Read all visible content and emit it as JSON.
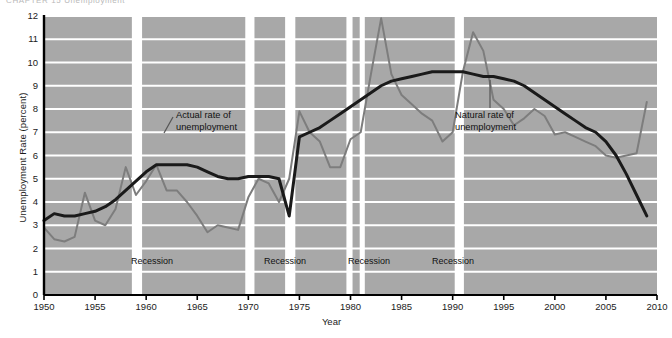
{
  "figure": {
    "top_fragment": "CHAPTER 15  Unemployment",
    "background_color": "#ffffff",
    "plot_band_color": "#a8a8a8",
    "gridline_color": "#ffffff",
    "axis_color": "#000000",
    "actual_line_color": "#7d7d7d",
    "natural_line_color": "#1a1a1a"
  },
  "annotations": [
    {
      "name": "actual-rate-annotation",
      "line1": "Actual rate of",
      "line2": "unemployment",
      "x": 176,
      "y": 110
    },
    {
      "name": "natural-rate-annotation",
      "line1": "Natural rate of",
      "line2": "unemployment",
      "x": 455,
      "y": 110
    }
  ],
  "recession_labels": [
    {
      "text": "Recession",
      "center_x": 152
    },
    {
      "text": "Recession",
      "center_x": 285
    },
    {
      "text": "Recession",
      "center_x": 369
    },
    {
      "text": "Recession",
      "center_x": 453
    }
  ],
  "recession_bands": [
    {
      "start": 1950.0,
      "end": 1958.6
    },
    {
      "start": 1959.6,
      "end": 1969.7
    },
    {
      "start": 1970.6,
      "end": 1973.6
    },
    {
      "start": 1974.6,
      "end": 1979.6
    },
    {
      "start": 1980.2,
      "end": 1980.9
    },
    {
      "start": 1981.4,
      "end": 1990.2
    },
    {
      "start": 1991.1,
      "end": 2010.0
    }
  ],
  "chart_data": {
    "type": "line",
    "title": "",
    "xlabel": "Year",
    "ylabel": "Unemployment Rate (percent)",
    "xlim": [
      1950,
      2010
    ],
    "ylim": [
      0,
      12
    ],
    "xticks": [
      1950,
      1955,
      1960,
      1965,
      1970,
      1975,
      1980,
      1985,
      1990,
      1995,
      2000,
      2005,
      2010
    ],
    "yticks": [
      0,
      1,
      2,
      3,
      4,
      5,
      6,
      7,
      8,
      9,
      10,
      11,
      12
    ],
    "grid": "horizontal",
    "legend": "annotations",
    "series": [
      {
        "name": "Actual rate of unemployment",
        "color": "#7d7d7d",
        "x": [
          1950,
          1951,
          1952,
          1953,
          1954,
          1955,
          1956,
          1957,
          1958,
          1959,
          1960,
          1961,
          1962,
          1963,
          1964,
          1965,
          1966,
          1967,
          1968,
          1969,
          1970,
          1971,
          1972,
          1973,
          1974,
          1975,
          1976,
          1977,
          1978,
          1979,
          1980,
          1981,
          1982,
          1983,
          1984,
          1985,
          1986,
          1987,
          1988,
          1989,
          1990,
          1991,
          1992,
          1993,
          1994,
          1995,
          1996,
          1997,
          1998,
          1999,
          2000,
          2001,
          2002,
          2003,
          2004,
          2005,
          2006,
          2007,
          2008,
          2009
        ],
        "values": [
          2.9,
          2.4,
          2.3,
          2.5,
          4.4,
          3.2,
          3.0,
          3.7,
          5.5,
          4.3,
          4.9,
          5.6,
          4.5,
          4.5,
          4.0,
          3.4,
          2.7,
          3.0,
          2.9,
          2.8,
          4.2,
          5.0,
          4.8,
          4.0,
          5.0,
          7.9,
          7.0,
          6.6,
          5.5,
          5.5,
          6.7,
          7.0,
          9.5,
          11.9,
          9.5,
          8.6,
          8.2,
          7.8,
          7.5,
          6.6,
          7.0,
          9.6,
          11.3,
          10.5,
          8.4,
          8.0,
          7.3,
          7.6,
          8.0,
          7.7,
          6.9,
          7.0,
          6.8,
          6.6,
          6.4,
          6.0,
          5.9,
          6.0,
          6.1,
          8.3
        ]
      },
      {
        "name": "Natural rate of unemployment",
        "color": "#1a1a1a",
        "x": [
          1950,
          1951,
          1952,
          1953,
          1954,
          1955,
          1956,
          1957,
          1958,
          1959,
          1960,
          1961,
          1962,
          1963,
          1964,
          1965,
          1966,
          1967,
          1968,
          1969,
          1970,
          1971,
          1972,
          1973,
          1974,
          1975,
          1976,
          1977,
          1978,
          1979,
          1980,
          1981,
          1982,
          1983,
          1984,
          1985,
          1986,
          1987,
          1988,
          1989,
          1990,
          1991,
          1992,
          1993,
          1994,
          1995,
          1996,
          1997,
          1998,
          1999,
          2000,
          2001,
          2002,
          2003,
          2004,
          2005,
          2006,
          2007,
          2008,
          2009
        ],
        "values": [
          3.2,
          3.5,
          3.4,
          3.4,
          3.5,
          3.6,
          3.8,
          4.1,
          4.5,
          4.9,
          5.3,
          5.6,
          5.6,
          5.6,
          5.6,
          5.5,
          5.3,
          5.1,
          5.0,
          5.0,
          5.1,
          5.1,
          5.1,
          5.0,
          3.4,
          6.8,
          7.0,
          7.2,
          7.5,
          7.8,
          8.1,
          8.4,
          8.7,
          9.0,
          9.2,
          9.3,
          9.4,
          9.5,
          9.6,
          9.6,
          9.6,
          9.6,
          9.5,
          9.4,
          9.4,
          9.3,
          9.2,
          9.0,
          8.7,
          8.4,
          8.1,
          7.8,
          7.5,
          7.2,
          7.0,
          6.6,
          6.0,
          5.2,
          4.3,
          3.4
        ]
      }
    ]
  }
}
